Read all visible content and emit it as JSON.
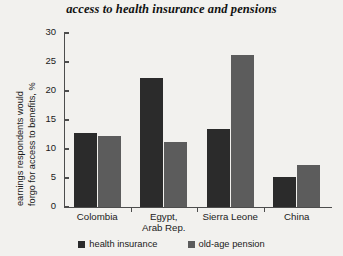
{
  "chart_data": {
    "type": "bar",
    "title": "access to health insurance and pensions",
    "xlabel": "",
    "ylabel_line1": "earnings respondents would",
    "ylabel_line2": "forgo for access to benefits, %",
    "categories": [
      "Colombia",
      "Egypt,\nArab Rep.",
      "Sierra Leone",
      "China"
    ],
    "series": [
      {
        "name": "health insurance",
        "color": "#2b2b2b",
        "values": [
          12.7,
          22.2,
          13.5,
          5.2
        ]
      },
      {
        "name": "old-age pension",
        "color": "#5c5c5c",
        "values": [
          12.3,
          11.2,
          26.2,
          7.2
        ]
      }
    ],
    "ylim": [
      0,
      30
    ],
    "yticks": [
      0,
      5,
      10,
      15,
      20,
      25,
      30
    ],
    "grid": false,
    "legend_position": "bottom"
  },
  "legend": {
    "items": [
      {
        "label": "health insurance"
      },
      {
        "label": "old-age pension"
      }
    ]
  },
  "colors": {
    "background": "#f2f1ee",
    "axis": "#4d4d4d",
    "text": "#1a1a1a",
    "health_insurance": "#2b2b2b",
    "old_age_pension": "#5c5c5c"
  }
}
